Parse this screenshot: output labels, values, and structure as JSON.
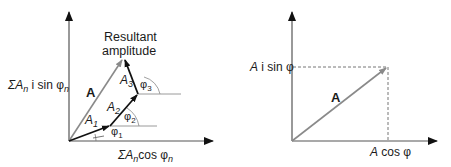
{
  "colors": {
    "axis": "#2a2a2a",
    "component_vector": "#111111",
    "resultant_vector": "#8a8a8a",
    "guide_line": "#9a9a9a",
    "text": "#1a1a1a"
  },
  "left_diagram": {
    "title": "Resultant amplitude",
    "title_line1": "Resultant",
    "title_line2": "amplitude",
    "y_axis_label": {
      "prefix": "ΣA",
      "sub": "n",
      "mid": " i sin φ",
      "sub2": "n"
    },
    "x_axis_label": {
      "prefix": "ΣA",
      "sub": "n",
      "mid": "cos φ",
      "sub2": "n"
    },
    "resultant_label": "A",
    "vectors": [
      {
        "label": "A",
        "sub": "1",
        "angle_label": "φ",
        "angle_sub": "1"
      },
      {
        "label": "A",
        "sub": "2",
        "angle_label": "φ",
        "angle_sub": "2"
      },
      {
        "label": "A",
        "sub": "3",
        "angle_label": "φ",
        "angle_sub": "3"
      }
    ]
  },
  "right_diagram": {
    "y_projection_label": {
      "a": "A",
      "rest": " i sin φ"
    },
    "x_projection_label": {
      "a": "A",
      "rest": " cos φ"
    },
    "vector_label": "A"
  }
}
